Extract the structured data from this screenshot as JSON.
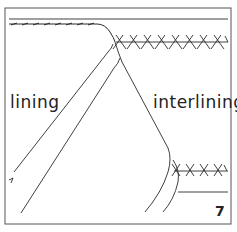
{
  "diagram": {
    "labels": {
      "left": "lining",
      "right": "interlining"
    },
    "step_number": "7",
    "colors": {
      "line": "#2a2a2a",
      "background": "#ffffff",
      "border": "#555555"
    }
  }
}
